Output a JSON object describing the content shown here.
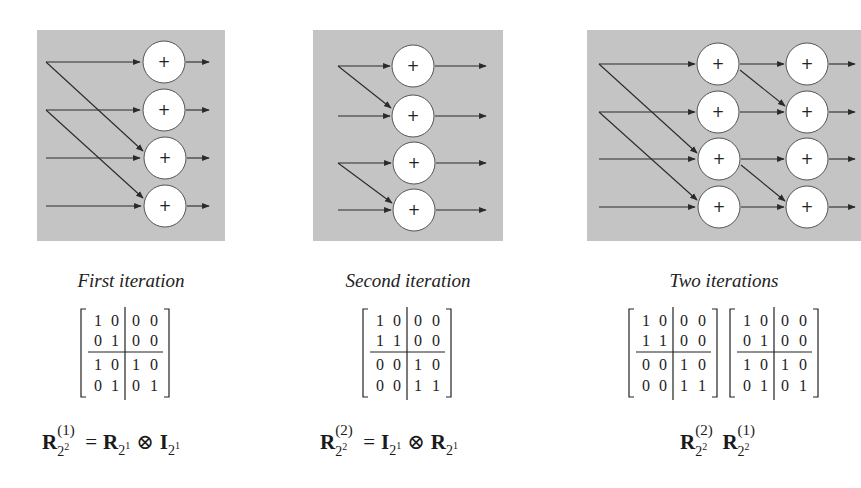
{
  "colors": {
    "panel_bg": "#c4c4c4",
    "node_fill": "#ffffff",
    "line": "#2a2a2a"
  },
  "panels": [
    {
      "caption": "First iteration",
      "node_symbol": "+",
      "matrix": [
        [
          1,
          0,
          0,
          0
        ],
        [
          0,
          1,
          0,
          0
        ],
        [
          1,
          0,
          1,
          0
        ],
        [
          0,
          1,
          0,
          1
        ]
      ],
      "formula": {
        "lhs": "R",
        "lhs_sup": "(1)",
        "lhs_sub": "2",
        "lhs_sub_exp": "2",
        "eq": "=",
        "t1": "R",
        "t1_sub": "2",
        "t1_sub_exp": "1",
        "op": "⊗",
        "t2": "I",
        "t2_sub": "2",
        "t2_sub_exp": "1"
      }
    },
    {
      "caption": "Second iteration",
      "node_symbol": "+",
      "matrix": [
        [
          1,
          0,
          0,
          0
        ],
        [
          1,
          1,
          0,
          0
        ],
        [
          0,
          0,
          1,
          0
        ],
        [
          0,
          0,
          1,
          1
        ]
      ],
      "formula": {
        "lhs": "R",
        "lhs_sup": "(2)",
        "lhs_sub": "2",
        "lhs_sub_exp": "2",
        "eq": "=",
        "t1": "I",
        "t1_sub": "2",
        "t1_sub_exp": "1",
        "op": "⊗",
        "t2": "R",
        "t2_sub": "2",
        "t2_sub_exp": "1"
      }
    },
    {
      "caption": "Two iterations",
      "node_symbol": "+",
      "matrices": [
        [
          [
            1,
            0,
            0,
            0
          ],
          [
            1,
            1,
            0,
            0
          ],
          [
            0,
            0,
            1,
            0
          ],
          [
            0,
            0,
            1,
            1
          ]
        ],
        [
          [
            1,
            0,
            0,
            0
          ],
          [
            0,
            1,
            0,
            0
          ],
          [
            1,
            0,
            1,
            0
          ],
          [
            0,
            1,
            0,
            1
          ]
        ]
      ],
      "formula": {
        "f1": "R",
        "f1_sup": "(2)",
        "f1_sub": "2",
        "f1_sub_exp": "2",
        "f2": "R",
        "f2_sup": "(1)",
        "f2_sub": "2",
        "f2_sub_exp": "2"
      }
    }
  ]
}
